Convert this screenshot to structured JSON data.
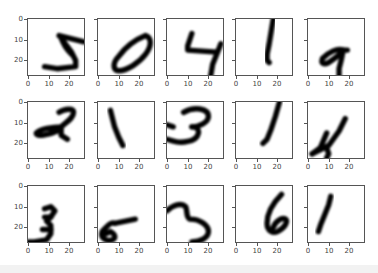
{
  "caption": "· · · ·",
  "chart_data": {
    "type": "image-grid",
    "title": "",
    "rows": 3,
    "cols": 5,
    "colormap": "gray_r",
    "image_size": [
      28,
      28
    ],
    "xticks": [
      "0",
      "10",
      "20"
    ],
    "yticks": [
      "0",
      "10",
      "20"
    ],
    "xlim": [
      0,
      27
    ],
    "ylim": [
      27,
      0
    ],
    "digits": [
      [
        "5",
        "0",
        "4",
        "1",
        "9"
      ],
      [
        "2",
        "1",
        "3",
        "1",
        "4"
      ],
      [
        "3",
        "5",
        "3",
        "6",
        "1"
      ]
    ]
  },
  "panels": [
    {
      "digit": "5",
      "show_ylabels": true,
      "paths": [
        "M15,8 L27,11",
        "M16,9 L18,12 L21,16 L23,20 L23,23 L14,24 L8,23",
        "M16,9 C17,12 19,15 21,17"
      ]
    },
    {
      "digit": "0",
      "show_ylabels": false,
      "paths": [
        "M23,8 C26,9 26,13 23,17 C20,21 14,25 10,25 C7,25 7,21 10,18 C13,14 18,10 23,8 Z"
      ]
    },
    {
      "digit": "4",
      "show_ylabels": false,
      "paths": [
        "M12,7 L10,13 L10,15 L24,16",
        "M26,12 L24,17 L22,22 L21,28"
      ]
    },
    {
      "digit": "1",
      "show_ylabels": false,
      "paths": [
        "M18,0 L17,6 L16,12 L15,17 L15,20 L16,21"
      ]
    },
    {
      "digit": "9",
      "show_ylabels": false,
      "paths": [
        "M17,15 C14,14 10,16 7,19 C6,22 8,22 10,21 C13,19 16,17 17,15 L19,15",
        "M17,15 L16,20 L15,24 L15,28"
      ]
    },
    {
      "digit": "2",
      "show_ylabels": true,
      "paths": [
        "M15,5 C18,3 22,3 22,5 C22,8 18,10 16,12 L16,16 L19,18",
        "M16,12 C12,12 6,13 4,15 C4,17 10,16 14,14 L16,12"
      ]
    },
    {
      "digit": "1",
      "show_ylabels": false,
      "paths": [
        "M6,4 L7,8 L8,12 L10,17 L12,21"
      ]
    },
    {
      "digit": "3",
      "show_ylabels": false,
      "paths": [
        "M8,5 C13,2 20,3 20,7 C20,10 15,12 12,12",
        "M12,12 C17,12 16,18 10,19 C6,20 3,19 0,18",
        "M0,11 L3,12"
      ]
    },
    {
      "digit": "1",
      "show_ylabels": false,
      "paths": [
        "M21,0 L19,7 L17,13 L15,18 L13,20"
      ]
    },
    {
      "digit": "4",
      "show_ylabels": false,
      "paths": [
        "M9,15 L6,22 L2,25",
        "M2,25 L10,21 L15,14 L18,8",
        "M9,22 L10,25 L9,27"
      ]
    },
    {
      "digit": "3",
      "show_ylabels": true,
      "paths": [
        "M8,11 L11,10 L13,12 L11,15 L9,17 L11,19 L11,23 L9,26 L3,27 L0,27",
        "M8,15 L11,15",
        "M7,21 L11,21"
      ]
    },
    {
      "digit": "5",
      "show_ylabels": false,
      "paths": [
        "M8,18 L18,16",
        "M8,18 C6,17 4,20 2,22 C1,25 4,27 7,26 C9,25 8,23 6,22 L4,23"
      ]
    },
    {
      "digit": "3",
      "show_ylabels": false,
      "paths": [
        "M0,12 C3,9 7,8 9,10 C10,12 9,15 11,16 C16,16 20,19 20,22 C20,25 16,27 12,27"
      ]
    },
    {
      "digit": "6",
      "show_ylabels": false,
      "paths": [
        "M22,4 C18,8 15,13 15,18 C15,22 18,23 20,22 C24,20 25,17 24,16 C22,15 19,17 18,20"
      ]
    },
    {
      "digit": "1",
      "show_ylabels": false,
      "paths": [
        "M11,5 L10,9 L8,14 L6,19 L5,22"
      ]
    }
  ],
  "layout": {
    "col_x": [
      27,
      97,
      166,
      235,
      307
    ],
    "row_y": [
      18,
      101,
      185
    ]
  }
}
